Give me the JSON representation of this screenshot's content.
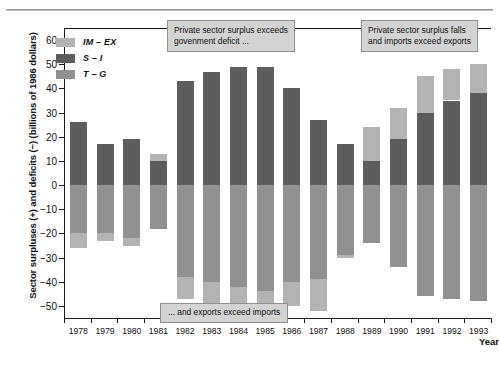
{
  "figure": {
    "y_axis_title": "Sector surpluses (+) and deficits (−) (billions of 1986 dollars)",
    "x_axis_title": "Year"
  },
  "legend": {
    "items": [
      {
        "label": "IM – EX",
        "color": "#b3b3b3"
      },
      {
        "label": "S – I",
        "color": "#5d5d5d"
      },
      {
        "label": "T – G",
        "color": "#919191"
      }
    ]
  },
  "annotations": [
    {
      "name": "private-surplus-exceeds-deficit",
      "text": "Private sector surplus exceeds\ngovenment deficit ..."
    },
    {
      "name": "private-surplus-falls",
      "text": "Private sector surplus falls\nand imports exceed exports"
    },
    {
      "name": "exports-exceed-imports",
      "text": "... and exports exceed imports"
    }
  ],
  "y_ticks": [
    60,
    50,
    40,
    30,
    20,
    10,
    0,
    -10,
    -20,
    -30,
    -40,
    -50
  ],
  "y_tick_labels": [
    "60",
    "50",
    "40",
    "30",
    "20",
    "10",
    "0",
    "−10",
    "−20",
    "−30",
    "−40",
    "−50"
  ],
  "chart_data": {
    "type": "bar",
    "title": "",
    "subtitle": "",
    "xlabel": "Year",
    "ylabel": "Sector surpluses (+) and deficits (−) (billions of 1986 dollars)",
    "ylim": [
      -55,
      65
    ],
    "grid": false,
    "stacked": true,
    "legend_position": "top-left",
    "categories": [
      "1978",
      "1979",
      "1980",
      "1981",
      "1982",
      "1983",
      "1984",
      "1985",
      "1986",
      "1987",
      "1988",
      "1989",
      "1990",
      "1991",
      "1992",
      "1993"
    ],
    "series": [
      {
        "name": "IM – EX",
        "color": "#b3b3b3",
        "values": [
          -26,
          -24,
          -25,
          3,
          -47,
          -51,
          -54,
          -54,
          -50,
          -52,
          -30,
          4,
          8,
          15,
          13,
          12
        ]
      },
      {
        "name": "S – I",
        "color": "#5d5d5d",
        "values": [
          26,
          17,
          19,
          10,
          43,
          47,
          49,
          49,
          40,
          27,
          17,
          10,
          19,
          30,
          35,
          38
        ]
      },
      {
        "name": "T – G",
        "color": "#919191",
        "values": [
          -20,
          -20,
          -22,
          -18,
          -38,
          -40,
          -42,
          -44,
          -40,
          -39,
          -29,
          -24,
          -34,
          -46,
          -47,
          -48
        ]
      }
    ],
    "notes": [
      "Stacked bars: positive segments stack upward from zero; negative segments stack downward from zero.",
      "IM – EX is positive (plotted above zero, on top of S – I) in 1981 and 1989–1993.",
      "IM – EX is negative (plotted below zero, beneath T – G) in 1978–1980 and 1982–1988."
    ]
  },
  "bars": [
    {
      "year": "1978",
      "pos": [
        {
          "s": "S – I",
          "v": 26
        }
      ],
      "neg": [
        {
          "s": "T – G",
          "v": -20
        },
        {
          "s": "IM – EX",
          "v": -6
        }
      ]
    },
    {
      "year": "1979",
      "pos": [
        {
          "s": "S – I",
          "v": 17
        }
      ],
      "neg": [
        {
          "s": "T – G",
          "v": -20
        },
        {
          "s": "IM – EX",
          "v": -3
        }
      ]
    },
    {
      "year": "1980",
      "pos": [
        {
          "s": "S – I",
          "v": 19
        }
      ],
      "neg": [
        {
          "s": "T – G",
          "v": -22
        },
        {
          "s": "IM – EX",
          "v": -3
        }
      ]
    },
    {
      "year": "1981",
      "pos": [
        {
          "s": "S – I",
          "v": 10
        },
        {
          "s": "IM – EX",
          "v": 3
        }
      ],
      "neg": [
        {
          "s": "T – G",
          "v": -18
        }
      ]
    },
    {
      "year": "1982",
      "pos": [
        {
          "s": "S – I",
          "v": 43
        }
      ],
      "neg": [
        {
          "s": "T – G",
          "v": -38
        },
        {
          "s": "IM – EX",
          "v": -9
        }
      ]
    },
    {
      "year": "1983",
      "pos": [
        {
          "s": "S – I",
          "v": 47
        }
      ],
      "neg": [
        {
          "s": "T – G",
          "v": -40
        },
        {
          "s": "IM – EX",
          "v": -11
        }
      ]
    },
    {
      "year": "1984",
      "pos": [
        {
          "s": "S – I",
          "v": 49
        }
      ],
      "neg": [
        {
          "s": "T – G",
          "v": -42
        },
        {
          "s": "IM – EX",
          "v": -12
        }
      ]
    },
    {
      "year": "1985",
      "pos": [
        {
          "s": "S – I",
          "v": 49
        }
      ],
      "neg": [
        {
          "s": "T – G",
          "v": -44
        },
        {
          "s": "IM – EX",
          "v": -10
        }
      ]
    },
    {
      "year": "1986",
      "pos": [
        {
          "s": "S – I",
          "v": 40
        }
      ],
      "neg": [
        {
          "s": "T – G",
          "v": -40
        },
        {
          "s": "IM – EX",
          "v": -10
        }
      ]
    },
    {
      "year": "1987",
      "pos": [
        {
          "s": "S – I",
          "v": 27
        }
      ],
      "neg": [
        {
          "s": "T – G",
          "v": -39
        },
        {
          "s": "IM – EX",
          "v": -13
        }
      ]
    },
    {
      "year": "1988",
      "pos": [
        {
          "s": "S – I",
          "v": 17
        }
      ],
      "neg": [
        {
          "s": "T – G",
          "v": -29
        },
        {
          "s": "IM – EX",
          "v": -1
        }
      ]
    },
    {
      "year": "1989",
      "pos": [
        {
          "s": "S – I",
          "v": 10
        },
        {
          "s": "IM – EX",
          "v": 14
        }
      ],
      "neg": [
        {
          "s": "T – G",
          "v": -24
        }
      ]
    },
    {
      "year": "1990",
      "pos": [
        {
          "s": "S – I",
          "v": 19
        },
        {
          "s": "IM – EX",
          "v": 13
        }
      ],
      "neg": [
        {
          "s": "T – G",
          "v": -34
        }
      ]
    },
    {
      "year": "1991",
      "pos": [
        {
          "s": "S – I",
          "v": 30
        },
        {
          "s": "IM – EX",
          "v": 15
        }
      ],
      "neg": [
        {
          "s": "T – G",
          "v": -46
        }
      ]
    },
    {
      "year": "1992",
      "pos": [
        {
          "s": "S – I",
          "v": 35
        },
        {
          "s": "IM – EX",
          "v": 13
        }
      ],
      "neg": [
        {
          "s": "T – G",
          "v": -47
        }
      ]
    },
    {
      "year": "1993",
      "pos": [
        {
          "s": "S – I",
          "v": 38
        },
        {
          "s": "IM – EX",
          "v": 12
        }
      ],
      "neg": [
        {
          "s": "T – G",
          "v": -48
        }
      ]
    }
  ],
  "colors": {
    "im_ex": "#b3b3b3",
    "s_i": "#5d5d5d",
    "t_g": "#919191",
    "callout_bg": "#d3d3d3",
    "callout_border": "#8f8f8f",
    "axis": "#1a1a1a"
  }
}
